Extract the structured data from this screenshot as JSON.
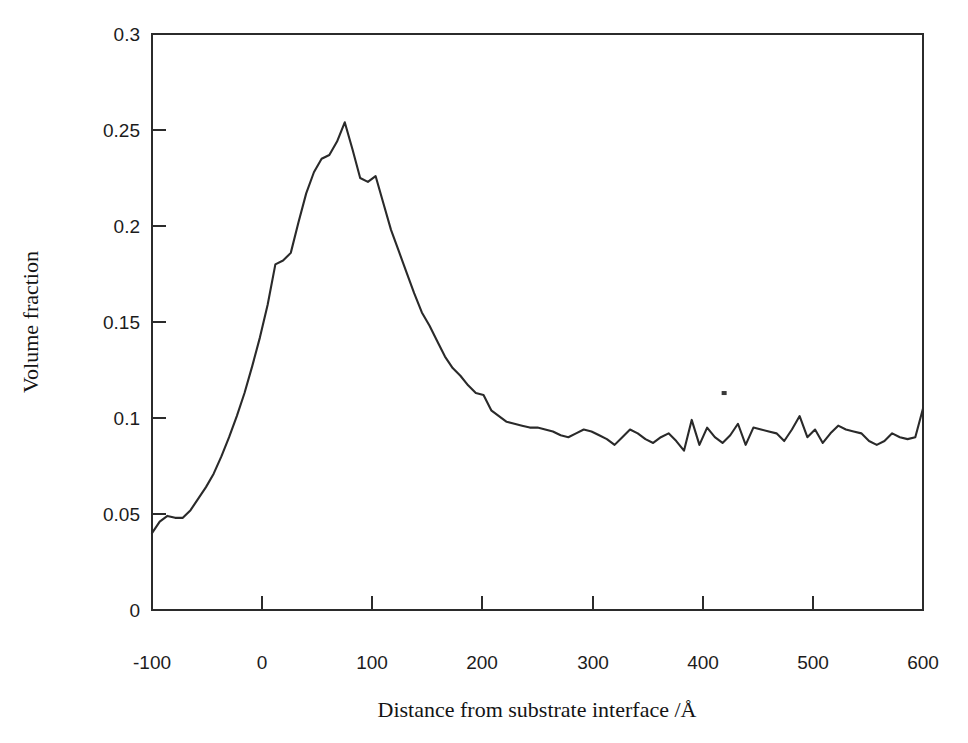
{
  "chart_data": {
    "type": "line",
    "title": "",
    "subtitle": "",
    "xlabel": "Distance from substrate interface /Å",
    "ylabel": "Volume fraction",
    "xlim": [
      -100,
      600
    ],
    "ylim": [
      0,
      0.3
    ],
    "grid": false,
    "legend": null,
    "x_ticks": [
      -100,
      0,
      100,
      200,
      300,
      400,
      500,
      600
    ],
    "x_tick_labels": [
      "-100",
      "0",
      "100",
      "200",
      "300",
      "400",
      "500",
      "600"
    ],
    "y_ticks": [
      0,
      0.05,
      0.1,
      0.15,
      0.2,
      0.25,
      0.3
    ],
    "y_tick_labels": [
      "0",
      "0.05",
      "0.1",
      "0.15",
      "0.2",
      "0.25",
      "0.3"
    ],
    "series": [
      {
        "name": "Volume fraction profile",
        "color": "#2a2a2a",
        "x": [
          -100,
          -93,
          -86,
          -79,
          -72,
          -65,
          -58,
          -51,
          -44,
          -37,
          -30,
          -23,
          -16,
          -9,
          -2,
          5,
          12,
          19,
          26,
          33,
          40,
          47,
          54,
          61,
          68,
          75,
          82,
          89,
          96,
          103,
          110,
          117,
          124,
          131,
          138,
          145,
          152,
          159,
          166,
          173,
          180,
          187,
          194,
          201,
          208,
          215,
          222,
          229,
          236,
          243,
          250,
          257,
          264,
          271,
          278,
          285,
          292,
          299,
          306,
          313,
          320,
          327,
          334,
          341,
          348,
          355,
          362,
          369,
          376,
          383,
          390,
          397,
          404,
          411,
          418,
          425,
          432,
          439,
          446,
          453,
          460,
          467,
          474,
          481,
          488,
          495,
          502,
          509,
          516,
          523,
          530,
          537,
          544,
          551,
          558,
          565,
          572,
          579,
          586,
          593,
          600
        ],
        "y": [
          0.04,
          0.046,
          0.049,
          0.048,
          0.048,
          0.052,
          0.058,
          0.064,
          0.071,
          0.08,
          0.09,
          0.101,
          0.113,
          0.127,
          0.142,
          0.159,
          0.18,
          0.182,
          0.186,
          0.202,
          0.217,
          0.228,
          0.235,
          0.237,
          0.244,
          0.254,
          0.24,
          0.225,
          0.223,
          0.226,
          0.212,
          0.198,
          0.187,
          0.176,
          0.165,
          0.155,
          0.148,
          0.14,
          0.132,
          0.126,
          0.122,
          0.117,
          0.113,
          0.112,
          0.104,
          0.101,
          0.098,
          0.097,
          0.096,
          0.095,
          0.095,
          0.094,
          0.093,
          0.091,
          0.09,
          0.092,
          0.094,
          0.093,
          0.091,
          0.089,
          0.086,
          0.09,
          0.094,
          0.092,
          0.089,
          0.087,
          0.09,
          0.092,
          0.088,
          0.083,
          0.099,
          0.086,
          0.095,
          0.09,
          0.087,
          0.091,
          0.097,
          0.086,
          0.095,
          0.094,
          0.093,
          0.092,
          0.088,
          0.094,
          0.101,
          0.09,
          0.094,
          0.087,
          0.092,
          0.096,
          0.094,
          0.093,
          0.092,
          0.088,
          0.086,
          0.088,
          0.092,
          0.09,
          0.089,
          0.09,
          0.105
        ]
      }
    ],
    "annotations": [
      {
        "name": "speck-artifact",
        "x": 419,
        "y": 0.113
      }
    ]
  }
}
